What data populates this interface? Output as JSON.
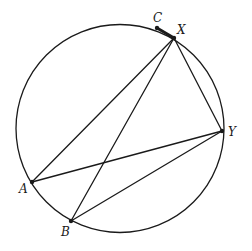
{
  "diagram": {
    "type": "circle-geometry",
    "stroke_color": "#1a1a1a",
    "background": "#ffffff",
    "circle": {
      "cx": 120,
      "cy": 128.5,
      "r": 104
    },
    "points": {
      "C": {
        "x": 157,
        "y": 28,
        "label": "C",
        "label_x": 153,
        "label_y": 22
      },
      "X": {
        "x": 174,
        "y": 38,
        "label": "X",
        "label_x": 177,
        "label_y": 34
      },
      "Y": {
        "x": 222,
        "y": 131,
        "label": "Y",
        "label_x": 228,
        "label_y": 136
      },
      "A": {
        "x": 32,
        "y": 182,
        "label": "A",
        "label_x": 19,
        "label_y": 193
      },
      "B": {
        "x": 71,
        "y": 221,
        "label": "B",
        "label_x": 61,
        "label_y": 236
      }
    },
    "segments": [
      {
        "from": "A",
        "to": "X",
        "weight": "normal"
      },
      {
        "from": "B",
        "to": "X",
        "weight": "normal"
      },
      {
        "from": "X",
        "to": "Y",
        "weight": "normal"
      },
      {
        "from": "A",
        "to": "Y",
        "weight": "normal"
      },
      {
        "from": "B",
        "to": "Y",
        "weight": "normal"
      },
      {
        "from": "C",
        "to": "X",
        "weight": "bold"
      }
    ]
  }
}
